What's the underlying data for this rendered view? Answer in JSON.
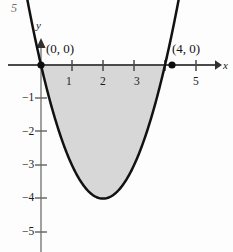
{
  "figure": {
    "corner_number": "5",
    "axis_labels": {
      "x": "x",
      "y": "y"
    },
    "point_labels": {
      "origin": "(0, 0)",
      "root_four": "(4, 0)"
    },
    "x_tick_labels": [
      "1",
      "2",
      "3",
      "5"
    ],
    "y_tick_labels": [
      "−1",
      "−2",
      "−3",
      "−4",
      "−5"
    ],
    "colors": {
      "curve": "#111111",
      "axis": "#4a4a4a",
      "shading": "#d7d7d7",
      "shading_edge": "#111111",
      "text": "#1a1a1a"
    }
  },
  "chart_data": {
    "type": "line",
    "title": "",
    "xlabel": "x",
    "ylabel": "y",
    "xlim": [
      -0.6,
      5.9
    ],
    "ylim": [
      -5.6,
      0.7
    ],
    "xticks": [
      1,
      2,
      3,
      5
    ],
    "xticklabels": [
      "1",
      "2",
      "3",
      "5"
    ],
    "yticks": [
      -1,
      -2,
      -3,
      -4,
      -5
    ],
    "yticklabels": [
      "−1",
      "−2",
      "−3",
      "−4",
      "−5"
    ],
    "grid": false,
    "legend": null,
    "series": [
      {
        "name": "y = x^2 - 4x",
        "equation": "y = x^2 - 4x",
        "x": [
          -0.35,
          -0.2,
          0,
          0.25,
          0.5,
          0.75,
          1,
          1.25,
          1.5,
          1.75,
          2,
          2.25,
          2.5,
          2.75,
          3,
          3.25,
          3.5,
          3.75,
          4,
          4.2,
          4.35
        ],
        "values": [
          1.52,
          0.84,
          0,
          -0.94,
          -1.75,
          -2.44,
          -3,
          -3.44,
          -3.75,
          -3.94,
          -4,
          -3.94,
          -3.75,
          -3.44,
          -3,
          -2.44,
          -1.75,
          -0.94,
          0,
          0.84,
          1.52
        ]
      }
    ],
    "shaded_region": {
      "description": "Region between the curve y = x^2 - 4x and the x-axis from x = 0 to x = 4",
      "x_from": 0,
      "x_to": 4,
      "fill": "#d7d7d7"
    },
    "annotations": [
      {
        "text": "(0, 0)",
        "x": 0,
        "y": 0,
        "marker": "filled-dot"
      },
      {
        "text": "(4, 0)",
        "x": 4,
        "y": 0,
        "marker": "filled-dot"
      }
    ]
  }
}
